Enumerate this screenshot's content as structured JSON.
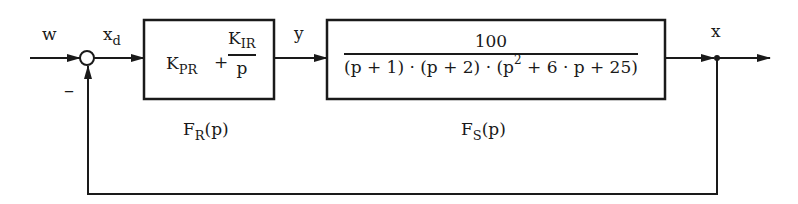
{
  "diagram": {
    "type": "closed-loop control block diagram",
    "colors": {
      "line": "#1a1a1a",
      "background": "#ffffff"
    },
    "signals": {
      "reference": "w",
      "error_main": "x",
      "error_sub": "d",
      "controller_output": "y",
      "output": "x",
      "feedback_sign": "–"
    },
    "controller": {
      "name_main": "F",
      "name_sub": "R",
      "name_arg": "(p)",
      "kp_main": "K",
      "kp_sub": "PR",
      "plus": "+",
      "ki_main": "K",
      "ki_sub": "IR",
      "ki_den": "p"
    },
    "plant": {
      "name_main": "F",
      "name_sub": "S",
      "name_arg": "(p)",
      "numerator": "100",
      "den_part1": "(p + 1) · (p + 2) · (p",
      "den_sup": "2",
      "den_part2": " + 6 · p + 25)"
    }
  }
}
